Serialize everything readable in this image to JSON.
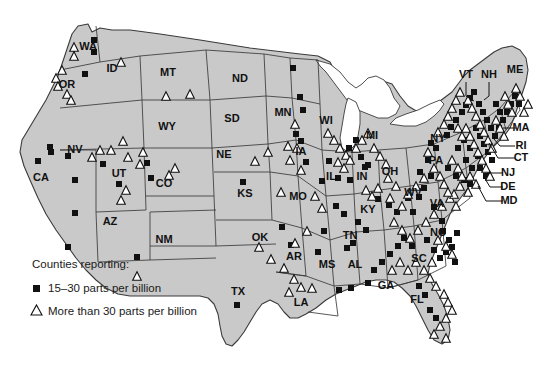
{
  "map": {
    "region": "United States",
    "fill_color": "#c9c9c9",
    "outline_color": "#3a3a3a",
    "water_color": "#ffffff",
    "background_color": "#ffffff",
    "marker_low_color": "#111111",
    "marker_high_fill": "#ffffff",
    "marker_high_stroke": "#111111"
  },
  "legend": {
    "title": "Counties reporting:",
    "items": [
      {
        "symbol": "filled-square",
        "label": "15–30 parts per billion"
      },
      {
        "symbol": "open-triangle",
        "label": "More than 30 parts per billion"
      }
    ]
  },
  "state_labels": [
    {
      "id": "WA",
      "text": "WA",
      "x": 88,
      "y": 47
    },
    {
      "id": "OR",
      "text": "OR",
      "x": 67,
      "y": 85
    },
    {
      "id": "ID",
      "text": "ID",
      "x": 112,
      "y": 69
    },
    {
      "id": "MT",
      "text": "MT",
      "x": 168,
      "y": 73
    },
    {
      "id": "ND",
      "text": "ND",
      "x": 240,
      "y": 79
    },
    {
      "id": "SD",
      "text": "SD",
      "x": 232,
      "y": 119
    },
    {
      "id": "WY",
      "text": "WY",
      "x": 167,
      "y": 127
    },
    {
      "id": "NV",
      "text": "NV",
      "x": 75,
      "y": 150
    },
    {
      "id": "UT",
      "text": "UT",
      "x": 119,
      "y": 174
    },
    {
      "id": "CA",
      "text": "CA",
      "x": 41,
      "y": 178
    },
    {
      "id": "CO",
      "text": "CO",
      "x": 164,
      "y": 184
    },
    {
      "id": "AZ",
      "text": "AZ",
      "x": 110,
      "y": 222
    },
    {
      "id": "NM",
      "text": "NM",
      "x": 164,
      "y": 240
    },
    {
      "id": "NE",
      "text": "NE",
      "x": 224,
      "y": 155
    },
    {
      "id": "KS",
      "text": "KS",
      "x": 245,
      "y": 194
    },
    {
      "id": "OK",
      "text": "OK",
      "x": 260,
      "y": 238
    },
    {
      "id": "TX",
      "text": "TX",
      "x": 238,
      "y": 292
    },
    {
      "id": "MN",
      "text": "MN",
      "x": 283,
      "y": 113
    },
    {
      "id": "IA",
      "text": "IA",
      "x": 301,
      "y": 152
    },
    {
      "id": "MO",
      "text": "MO",
      "x": 298,
      "y": 197
    },
    {
      "id": "AR",
      "text": "AR",
      "x": 294,
      "y": 257
    },
    {
      "id": "LA",
      "text": "LA",
      "x": 301,
      "y": 303
    },
    {
      "id": "WI",
      "text": "WI",
      "x": 326,
      "y": 121
    },
    {
      "id": "IL",
      "text": "IL",
      "x": 331,
      "y": 177
    },
    {
      "id": "MS",
      "text": "MS",
      "x": 327,
      "y": 265
    },
    {
      "id": "AL",
      "text": "AL",
      "x": 355,
      "y": 265
    },
    {
      "id": "MI",
      "text": "MI",
      "x": 372,
      "y": 136
    },
    {
      "id": "IN",
      "text": "IN",
      "x": 362,
      "y": 177
    },
    {
      "id": "OH",
      "text": "OH",
      "x": 390,
      "y": 172
    },
    {
      "id": "KY",
      "text": "KY",
      "x": 368,
      "y": 210
    },
    {
      "id": "TN",
      "text": "TN",
      "x": 350,
      "y": 236
    },
    {
      "id": "WV",
      "text": "WV",
      "x": 413,
      "y": 193
    },
    {
      "id": "GA",
      "text": "GA",
      "x": 386,
      "y": 286
    },
    {
      "id": "FL",
      "text": "FL",
      "x": 417,
      "y": 300
    },
    {
      "id": "SC",
      "text": "SC",
      "x": 419,
      "y": 259
    },
    {
      "id": "NC",
      "text": "NC",
      "x": 438,
      "y": 233
    },
    {
      "id": "VA",
      "text": "VA",
      "x": 437,
      "y": 204
    },
    {
      "id": "PA",
      "text": "PA",
      "x": 436,
      "y": 161
    },
    {
      "id": "NY",
      "text": "NY",
      "x": 438,
      "y": 139
    },
    {
      "id": "VT",
      "text": "VT",
      "x": 466,
      "y": 75
    },
    {
      "id": "NH",
      "text": "NH",
      "x": 489,
      "y": 75
    },
    {
      "id": "ME",
      "text": "ME",
      "x": 515,
      "y": 70
    },
    {
      "id": "MA",
      "text": "MA",
      "x": 521,
      "y": 128
    },
    {
      "id": "RI",
      "text": "RI",
      "x": 521,
      "y": 146
    },
    {
      "id": "CT",
      "text": "CT",
      "x": 521,
      "y": 158
    },
    {
      "id": "NJ",
      "text": "NJ",
      "x": 508,
      "y": 173
    },
    {
      "id": "DE",
      "text": "DE",
      "x": 508,
      "y": 187
    },
    {
      "id": "MD",
      "text": "MD",
      "x": 509,
      "y": 201
    }
  ],
  "leader_lines": [
    {
      "id": "VT",
      "x1": 466,
      "y1": 82,
      "x2": 466,
      "y2": 96,
      "x3": 474,
      "y3": 101
    },
    {
      "id": "NH",
      "x1": 489,
      "y1": 82,
      "x2": 489,
      "y2": 96,
      "x3": 484,
      "y3": 100
    },
    {
      "id": "MA",
      "x1": 516,
      "y1": 128,
      "x2": 503,
      "y2": 128
    },
    {
      "id": "RI",
      "x1": 515,
      "y1": 146,
      "x2": 500,
      "y2": 146,
      "x3": 494,
      "y3": 139
    },
    {
      "id": "CT",
      "x1": 515,
      "y1": 158,
      "x2": 498,
      "y2": 158,
      "x3": 489,
      "y3": 143
    },
    {
      "id": "NJ",
      "x1": 503,
      "y1": 173,
      "x2": 487,
      "y2": 173
    },
    {
      "id": "DE",
      "x1": 503,
      "y1": 187,
      "x2": 490,
      "y2": 187,
      "x3": 484,
      "y3": 177
    },
    {
      "id": "MD",
      "x1": 503,
      "y1": 201,
      "x2": 486,
      "y2": 201,
      "x3": 478,
      "y3": 186
    }
  ],
  "markers": {
    "squares": [
      [
        94,
        40
      ],
      [
        94,
        52
      ],
      [
        85,
        74
      ],
      [
        50,
        147
      ],
      [
        51,
        152
      ],
      [
        38,
        161
      ],
      [
        68,
        156
      ],
      [
        75,
        180
      ],
      [
        75,
        213
      ],
      [
        68,
        247
      ],
      [
        103,
        164
      ],
      [
        147,
        163
      ],
      [
        151,
        178
      ],
      [
        119,
        184
      ],
      [
        137,
        257
      ],
      [
        237,
        305
      ],
      [
        243,
        182
      ],
      [
        322,
        181
      ],
      [
        296,
        134
      ],
      [
        301,
        141
      ],
      [
        306,
        162
      ],
      [
        293,
        68
      ],
      [
        300,
        97
      ],
      [
        303,
        110
      ],
      [
        349,
        148
      ],
      [
        356,
        140
      ],
      [
        361,
        157
      ],
      [
        365,
        167
      ],
      [
        338,
        178
      ],
      [
        350,
        180
      ],
      [
        282,
        227
      ],
      [
        291,
        245
      ],
      [
        318,
        252
      ],
      [
        324,
        231
      ],
      [
        347,
        248
      ],
      [
        353,
        243
      ],
      [
        339,
        290
      ],
      [
        351,
        288
      ],
      [
        368,
        283
      ],
      [
        329,
        161
      ],
      [
        368,
        165
      ],
      [
        378,
        199
      ],
      [
        389,
        205
      ],
      [
        397,
        212
      ],
      [
        408,
        198
      ],
      [
        413,
        212
      ],
      [
        419,
        197
      ],
      [
        424,
        188
      ],
      [
        420,
        172
      ],
      [
        428,
        160
      ],
      [
        431,
        176
      ],
      [
        434,
        207
      ],
      [
        442,
        221
      ],
      [
        443,
        231
      ],
      [
        449,
        240
      ],
      [
        452,
        247
      ],
      [
        457,
        233
      ],
      [
        431,
        143
      ],
      [
        436,
        148
      ],
      [
        447,
        135
      ],
      [
        451,
        127
      ],
      [
        456,
        120
      ],
      [
        462,
        112
      ],
      [
        466,
        105
      ],
      [
        470,
        98
      ],
      [
        474,
        92
      ],
      [
        479,
        104
      ],
      [
        483,
        112
      ],
      [
        487,
        120
      ],
      [
        491,
        128
      ],
      [
        495,
        136
      ],
      [
        499,
        128
      ],
      [
        503,
        120
      ],
      [
        507,
        112
      ],
      [
        511,
        104
      ],
      [
        515,
        96
      ],
      [
        519,
        104
      ],
      [
        496,
        104
      ],
      [
        500,
        112
      ],
      [
        476,
        128
      ],
      [
        480,
        136
      ],
      [
        484,
        144
      ],
      [
        488,
        152
      ],
      [
        492,
        160
      ],
      [
        478,
        156
      ],
      [
        470,
        148
      ],
      [
        464,
        140
      ],
      [
        458,
        148
      ],
      [
        466,
        160
      ],
      [
        472,
        168
      ],
      [
        480,
        168
      ],
      [
        486,
        176
      ],
      [
        448,
        168
      ],
      [
        456,
        176
      ],
      [
        464,
        180
      ],
      [
        470,
        184
      ],
      [
        427,
        240
      ],
      [
        434,
        250
      ],
      [
        440,
        258
      ],
      [
        446,
        252
      ],
      [
        455,
        262
      ],
      [
        430,
        310
      ],
      [
        436,
        318
      ],
      [
        425,
        295
      ],
      [
        419,
        286
      ],
      [
        374,
        270
      ],
      [
        382,
        262
      ],
      [
        390,
        254
      ],
      [
        398,
        246
      ],
      [
        404,
        238
      ],
      [
        412,
        246
      ],
      [
        358,
        222
      ],
      [
        366,
        230
      ],
      [
        344,
        214
      ],
      [
        336,
        206
      ]
    ],
    "triangles": [
      [
        74,
        47
      ],
      [
        74,
        56
      ],
      [
        56,
        78
      ],
      [
        58,
        86
      ],
      [
        62,
        70
      ],
      [
        67,
        94
      ],
      [
        71,
        100
      ],
      [
        121,
        62
      ],
      [
        166,
        96
      ],
      [
        190,
        94
      ],
      [
        92,
        157
      ],
      [
        100,
        150
      ],
      [
        111,
        150
      ],
      [
        123,
        141
      ],
      [
        128,
        157
      ],
      [
        137,
        276
      ],
      [
        140,
        164
      ],
      [
        143,
        152
      ],
      [
        126,
        190
      ],
      [
        121,
        200
      ],
      [
        169,
        175
      ],
      [
        175,
        168
      ],
      [
        255,
        161
      ],
      [
        268,
        152
      ],
      [
        281,
        192
      ],
      [
        259,
        247
      ],
      [
        271,
        259
      ],
      [
        284,
        268
      ],
      [
        294,
        279
      ],
      [
        301,
        287
      ],
      [
        295,
        124
      ],
      [
        288,
        146
      ],
      [
        297,
        148
      ],
      [
        290,
        160
      ],
      [
        301,
        170
      ],
      [
        315,
        196
      ],
      [
        322,
        208
      ],
      [
        307,
        231
      ],
      [
        295,
        243
      ],
      [
        289,
        292
      ],
      [
        312,
        288
      ],
      [
        328,
        133
      ],
      [
        334,
        140
      ],
      [
        340,
        148
      ],
      [
        346,
        155
      ],
      [
        338,
        162
      ],
      [
        344,
        168
      ],
      [
        350,
        160
      ],
      [
        356,
        148
      ],
      [
        362,
        140
      ],
      [
        368,
        133
      ],
      [
        374,
        148
      ],
      [
        380,
        156
      ],
      [
        386,
        164
      ],
      [
        366,
        190
      ],
      [
        372,
        196
      ],
      [
        378,
        188
      ],
      [
        388,
        178
      ],
      [
        396,
        186
      ],
      [
        390,
        198
      ],
      [
        402,
        206
      ],
      [
        408,
        194
      ],
      [
        416,
        186
      ],
      [
        424,
        178
      ],
      [
        394,
        222
      ],
      [
        402,
        230
      ],
      [
        410,
        238
      ],
      [
        418,
        230
      ],
      [
        426,
        222
      ],
      [
        434,
        214
      ],
      [
        442,
        206
      ],
      [
        450,
        198
      ],
      [
        456,
        206
      ],
      [
        438,
        240
      ],
      [
        446,
        246
      ],
      [
        452,
        254
      ],
      [
        432,
        262
      ],
      [
        424,
        270
      ],
      [
        416,
        262
      ],
      [
        408,
        270
      ],
      [
        400,
        262
      ],
      [
        392,
        270
      ],
      [
        430,
        278
      ],
      [
        436,
        286
      ],
      [
        444,
        294
      ],
      [
        448,
        302
      ],
      [
        452,
        310
      ],
      [
        446,
        318
      ],
      [
        440,
        326
      ],
      [
        434,
        334
      ],
      [
        446,
        338
      ],
      [
        458,
        128
      ],
      [
        462,
        136
      ],
      [
        466,
        128
      ],
      [
        470,
        136
      ],
      [
        474,
        144
      ],
      [
        478,
        152
      ],
      [
        482,
        160
      ],
      [
        486,
        168
      ],
      [
        490,
        176
      ],
      [
        452,
        160
      ],
      [
        458,
        168
      ],
      [
        462,
        176
      ],
      [
        470,
        176
      ],
      [
        476,
        184
      ],
      [
        468,
        192
      ],
      [
        460,
        186
      ],
      [
        454,
        194
      ],
      [
        440,
        176
      ],
      [
        444,
        184
      ],
      [
        448,
        192
      ],
      [
        434,
        168
      ],
      [
        428,
        152
      ],
      [
        438,
        132
      ],
      [
        444,
        124
      ],
      [
        448,
        116
      ],
      [
        452,
        108
      ],
      [
        456,
        100
      ],
      [
        460,
        92
      ],
      [
        468,
        100
      ],
      [
        472,
        108
      ],
      [
        476,
        116
      ],
      [
        480,
        124
      ],
      [
        484,
        132
      ],
      [
        488,
        140
      ],
      [
        492,
        148
      ],
      [
        496,
        120
      ],
      [
        500,
        128
      ],
      [
        504,
        136
      ],
      [
        508,
        104
      ],
      [
        512,
        112
      ],
      [
        516,
        88
      ],
      [
        520,
        96
      ],
      [
        524,
        112
      ],
      [
        528,
        104
      ],
      [
        505,
        96
      ]
    ]
  }
}
